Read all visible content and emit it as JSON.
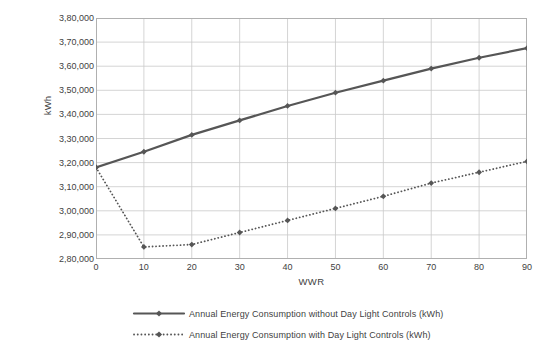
{
  "chart_data": {
    "type": "line",
    "title": "",
    "xlabel": "WWR",
    "ylabel": "kWh",
    "x": [
      0,
      10,
      20,
      30,
      40,
      50,
      60,
      70,
      80,
      90
    ],
    "xlim": [
      0,
      90
    ],
    "ylim": [
      280000,
      380000
    ],
    "y_tick_labels": [
      "3,80,000",
      "3,70,000",
      "3,60,000",
      "3,50,000",
      "3,40,000",
      "3,30,000",
      "3,20,000",
      "3,10,000",
      "3,00,000",
      "2,90,000",
      "2,80,000"
    ],
    "y_tick_values": [
      380000,
      370000,
      360000,
      350000,
      340000,
      330000,
      320000,
      310000,
      300000,
      290000,
      280000
    ],
    "x_tick_labels": [
      "0",
      "10",
      "20",
      "30",
      "40",
      "50",
      "60",
      "70",
      "80",
      "90"
    ],
    "grid": true,
    "legend_position": "bottom",
    "series": [
      {
        "name": "Annual Energy Consumption without Day Light Controls (kWh)",
        "style": "solid",
        "color": "#565656",
        "marker": "diamond",
        "values": [
          318000,
          324500,
          331500,
          337500,
          343500,
          349000,
          354000,
          359000,
          363500,
          367500
        ]
      },
      {
        "name": "Annual Energy Consumption with Day Light Controls (kWh)",
        "style": "dotted",
        "color": "#565656",
        "marker": "diamond",
        "values": [
          318000,
          285000,
          286000,
          291000,
          296000,
          301000,
          306000,
          311500,
          316000,
          320500
        ]
      }
    ]
  },
  "axis": {
    "y_title": "kWh",
    "x_title": "WWR"
  },
  "colors": {
    "series_line": "#565656",
    "grid": "#c9c9c9",
    "plot_border": "#b0b0b0",
    "text": "#3f3f3f",
    "background": "#ffffff"
  }
}
